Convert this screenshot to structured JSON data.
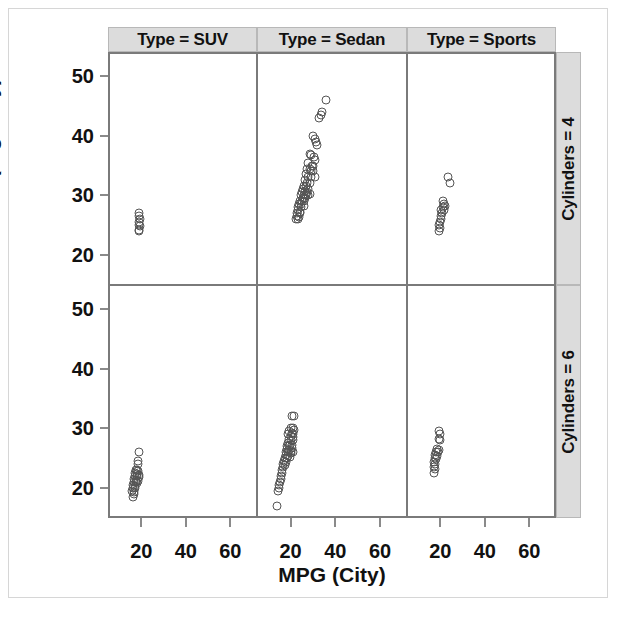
{
  "chart_data": {
    "type": "scatter",
    "title": "",
    "xlabel": "MPG (City)",
    "ylabel": "MPG (Highway)",
    "xlim": [
      5,
      72
    ],
    "ylim": [
      15,
      54
    ],
    "xticks": [
      20,
      40,
      60
    ],
    "yticks": [
      20,
      30,
      40,
      50
    ],
    "grid": false,
    "legend": "none",
    "facet_col_label_prefix": "Type",
    "facet_row_label_prefix": "Cylinders",
    "col_strips": [
      "Type = SUV",
      "Type = Sedan",
      "Type = Sports"
    ],
    "row_strips": [
      "Cylinders = 4",
      "Cylinders = 6"
    ],
    "marker": "open-circle",
    "marker_color": "#555555",
    "panels": [
      {
        "row_label": "Cylinders = 4",
        "col_label": "Type = SUV",
        "points": [
          [
            19,
            27
          ],
          [
            19,
            26.5
          ],
          [
            19.3,
            26
          ],
          [
            18.8,
            25.5
          ],
          [
            19,
            25
          ],
          [
            19.2,
            24.8
          ],
          [
            18.9,
            24.2
          ],
          [
            19.1,
            24
          ]
        ]
      },
      {
        "row_label": "Cylinders = 4",
        "col_label": "Type = Sedan",
        "points": [
          [
            36,
            46
          ],
          [
            34,
            44
          ],
          [
            33.5,
            43.5
          ],
          [
            32.5,
            43
          ],
          [
            30,
            40
          ],
          [
            31,
            39.5
          ],
          [
            31.5,
            39
          ],
          [
            32,
            38.5
          ],
          [
            28.5,
            37
          ],
          [
            29,
            36.8
          ],
          [
            30.5,
            36.5
          ],
          [
            31,
            36
          ],
          [
            28,
            35.5
          ],
          [
            29.5,
            35
          ],
          [
            30,
            35
          ],
          [
            27.5,
            34.5
          ],
          [
            28.5,
            34.5
          ],
          [
            29,
            34
          ],
          [
            30,
            34
          ],
          [
            31,
            33
          ],
          [
            27,
            33.5
          ],
          [
            28,
            33
          ],
          [
            29,
            33
          ],
          [
            26.5,
            32.5
          ],
          [
            27.5,
            32
          ],
          [
            28.5,
            32
          ],
          [
            26,
            31.5
          ],
          [
            27,
            31.5
          ],
          [
            28,
            31
          ],
          [
            25.5,
            31
          ],
          [
            26.5,
            30.8
          ],
          [
            27.5,
            30.5
          ],
          [
            28.5,
            30.3
          ],
          [
            25,
            30.5
          ],
          [
            26,
            30
          ],
          [
            27,
            30
          ],
          [
            28,
            30
          ],
          [
            24.5,
            30
          ],
          [
            25.5,
            29.5
          ],
          [
            26.5,
            29.5
          ],
          [
            24,
            29
          ],
          [
            25,
            29
          ],
          [
            26,
            29
          ],
          [
            23.8,
            28.5
          ],
          [
            24.8,
            28.5
          ],
          [
            25.8,
            28.3
          ],
          [
            23.5,
            28
          ],
          [
            24.5,
            28
          ],
          [
            23.2,
            27.5
          ],
          [
            24.2,
            27.3
          ],
          [
            23,
            27
          ],
          [
            24,
            27
          ],
          [
            22.8,
            26.5
          ],
          [
            23.8,
            26.3
          ],
          [
            22.5,
            26
          ],
          [
            23.5,
            26
          ]
        ]
      },
      {
        "row_label": "Cylinders = 4",
        "col_label": "Type = Sports",
        "points": [
          [
            23.5,
            33
          ],
          [
            24.5,
            32
          ],
          [
            21,
            29
          ],
          [
            21.5,
            28.5
          ],
          [
            22,
            28.3
          ],
          [
            21.2,
            28
          ],
          [
            20.5,
            27.5
          ],
          [
            21.8,
            27.5
          ],
          [
            20.8,
            27
          ],
          [
            20.2,
            26.5
          ],
          [
            20.5,
            26
          ],
          [
            20,
            25.5
          ],
          [
            19.5,
            25
          ],
          [
            19.8,
            24.5
          ],
          [
            19.6,
            24
          ]
        ]
      },
      {
        "row_label": "Cylinders = 6",
        "col_label": "Type = SUV",
        "points": [
          [
            19,
            26
          ],
          [
            18.5,
            24.5
          ],
          [
            18.6,
            24
          ],
          [
            17.5,
            23
          ],
          [
            18,
            23
          ],
          [
            18.5,
            22.8
          ],
          [
            17.2,
            22.5
          ],
          [
            18.2,
            22.3
          ],
          [
            19,
            22.2
          ],
          [
            17,
            22
          ],
          [
            18,
            22
          ],
          [
            18.8,
            21.8
          ],
          [
            16.8,
            21.5
          ],
          [
            17.8,
            21.3
          ],
          [
            18.5,
            21.2
          ],
          [
            16.5,
            21
          ],
          [
            17.5,
            21
          ],
          [
            18.2,
            20.8
          ],
          [
            16.3,
            20.5
          ],
          [
            17.2,
            20.3
          ],
          [
            16.2,
            20
          ],
          [
            17,
            20
          ],
          [
            16,
            19.5
          ],
          [
            16.8,
            19.3
          ],
          [
            16.5,
            19
          ],
          [
            16.2,
            18.5
          ]
        ]
      },
      {
        "row_label": "Cylinders = 6",
        "col_label": "Type = Sedan",
        "points": [
          [
            20.5,
            32
          ],
          [
            21.5,
            32
          ],
          [
            20,
            30
          ],
          [
            21,
            30
          ],
          [
            21.5,
            29.8
          ],
          [
            19.5,
            29.5
          ],
          [
            20.5,
            29.3
          ],
          [
            21,
            29
          ],
          [
            19,
            29
          ],
          [
            20,
            28.8
          ],
          [
            21,
            28.5
          ],
          [
            19.2,
            28.3
          ],
          [
            20.2,
            28
          ],
          [
            21.2,
            28
          ],
          [
            18.8,
            27.5
          ],
          [
            19.8,
            27.3
          ],
          [
            20.8,
            27.2
          ],
          [
            18.5,
            27
          ],
          [
            19.5,
            27
          ],
          [
            20.5,
            26.8
          ],
          [
            18.2,
            26.5
          ],
          [
            19.2,
            26.3
          ],
          [
            20.2,
            26.2
          ],
          [
            21,
            26
          ],
          [
            18,
            26
          ],
          [
            19,
            26
          ],
          [
            20,
            25.8
          ],
          [
            17.8,
            25.5
          ],
          [
            18.8,
            25.3
          ],
          [
            19.8,
            25.2
          ],
          [
            17.5,
            25
          ],
          [
            18.5,
            25
          ],
          [
            17.2,
            24.5
          ],
          [
            18,
            24.3
          ],
          [
            16.8,
            24
          ],
          [
            17.5,
            23.8
          ],
          [
            16.5,
            23.5
          ],
          [
            16.2,
            23
          ],
          [
            16,
            22.5
          ],
          [
            15.8,
            22
          ],
          [
            15.5,
            21.5
          ],
          [
            15.2,
            21
          ],
          [
            15,
            20.5
          ],
          [
            14.8,
            20
          ],
          [
            14.5,
            19.5
          ],
          [
            14,
            17
          ]
        ]
      },
      {
        "row_label": "Cylinders = 6",
        "col_label": "Type = Sports",
        "points": [
          [
            19.5,
            29.5
          ],
          [
            19.8,
            29
          ],
          [
            19.6,
            28.3
          ],
          [
            19.7,
            28
          ],
          [
            18.5,
            26.5
          ],
          [
            19.2,
            26.3
          ],
          [
            18.2,
            26
          ],
          [
            19,
            26
          ],
          [
            17.8,
            25.5
          ],
          [
            18.5,
            25.3
          ],
          [
            17.5,
            25
          ],
          [
            18,
            24.8
          ],
          [
            17.2,
            24.3
          ],
          [
            17.8,
            24
          ],
          [
            17,
            23.5
          ],
          [
            17.5,
            23.2
          ],
          [
            17.2,
            22.5
          ]
        ]
      }
    ]
  }
}
